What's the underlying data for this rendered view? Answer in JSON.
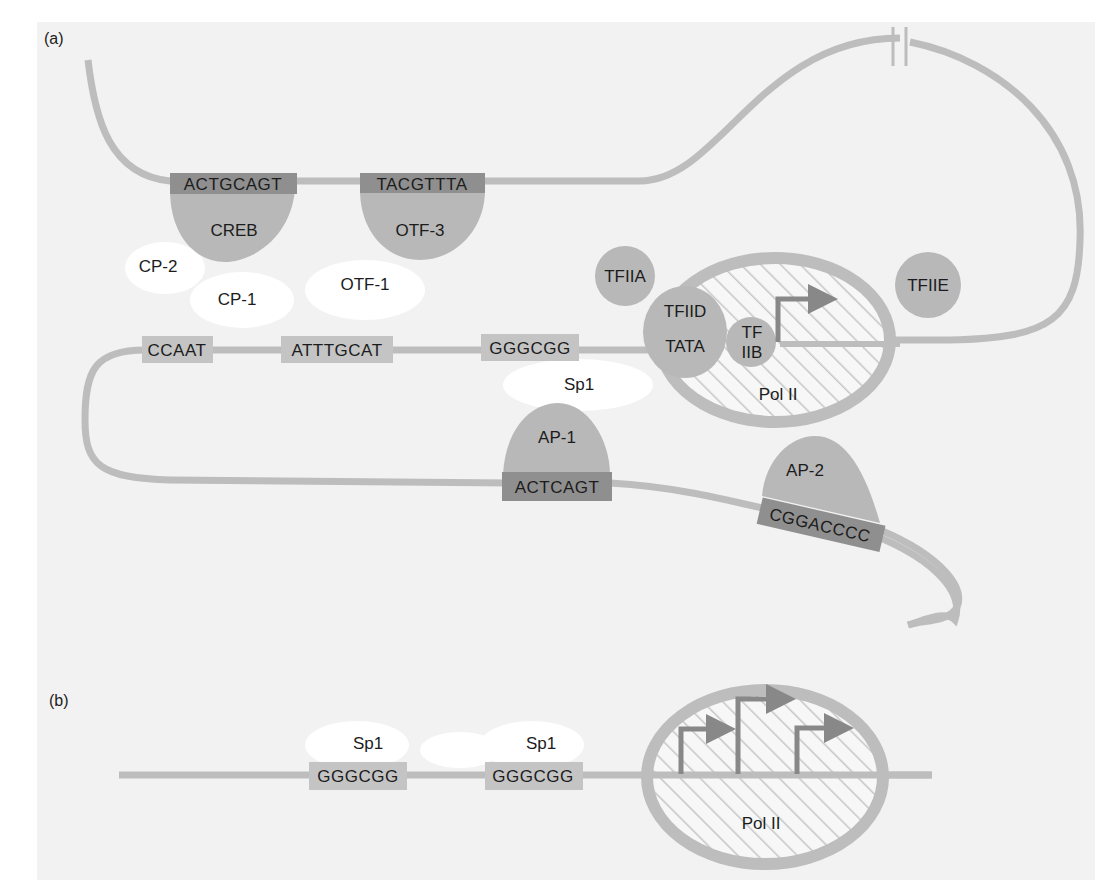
{
  "colors": {
    "page_bg": "#ffffff",
    "panel_bg": "#f2f2f2",
    "dna": "#bdbdbd",
    "protein": "#b8b8b8",
    "dark_box": "#8f8f8f",
    "light_box": "#c4c4c4",
    "white_protein": "#ffffff",
    "hatch": "#c9c9c9",
    "arrow": "#888888",
    "text": "#1c1c1c"
  },
  "panel_a": {
    "label": "(a)",
    "sites": [
      {
        "id": "creb-site",
        "sequence": "ACTGCAGT",
        "style": "dark"
      },
      {
        "id": "otf3-site",
        "sequence": "TACGTTTA",
        "style": "dark"
      },
      {
        "id": "ccaat-site",
        "sequence": "CCAAT",
        "style": "light"
      },
      {
        "id": "octamer-site",
        "sequence": "ATTTGCAT",
        "style": "light"
      },
      {
        "id": "gc-box-site",
        "sequence": "GGGCGG",
        "style": "light"
      },
      {
        "id": "ap1-site",
        "sequence": "ACTCAGT",
        "style": "dark"
      },
      {
        "id": "ap2-site",
        "sequence": "CGGACCCC",
        "style": "dark"
      }
    ],
    "proteins": {
      "creb": "CREB",
      "otf3": "OTF-3",
      "cp2": "CP-2",
      "cp1": "CP-1",
      "otf1": "OTF-1",
      "sp1": "Sp1",
      "ap1": "AP-1",
      "ap2": "AP-2",
      "tfiia": "TFIIA",
      "tfiid": "TFIID",
      "tata": "TATA",
      "tfiib_line1": "TF",
      "tfiib_line2": "IIB",
      "tfiie": "TFIIE",
      "pol2": "Pol II"
    },
    "break_mark": "DNA break symbol (//)"
  },
  "panel_b": {
    "label": "(b)",
    "sites": [
      {
        "sequence": "GGGCGG",
        "protein": "Sp1"
      },
      {
        "sequence": "GGGCGG",
        "protein": "Sp1"
      }
    ],
    "pol2": "Pol II",
    "start_sites": 3
  }
}
